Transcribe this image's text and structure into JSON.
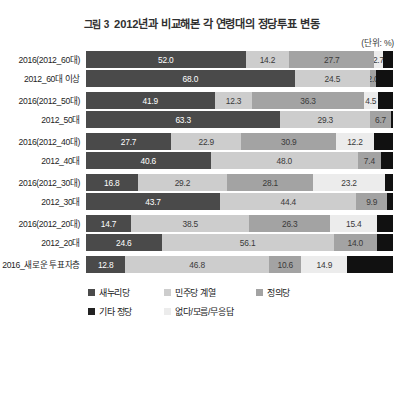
{
  "header": {
    "figure_number": "그림 3",
    "title": "2012년과 비교해본 각 연령대의 정당투표 변동",
    "unit_note": "(단위: %)"
  },
  "legend": {
    "items": [
      {
        "label": "새누리당",
        "color": "#4a4a4a"
      },
      {
        "label": "민주당 계열",
        "color": "#cdcdcd"
      },
      {
        "label": "정의당",
        "color": "#a3a3a3"
      },
      {
        "label": "기타 정당",
        "color": "#222222"
      },
      {
        "label": "없다/모름/무응답",
        "color": "#ececec"
      }
    ]
  },
  "chart_data": {
    "type": "bar",
    "orientation": "horizontal",
    "stacked": true,
    "stack_normalized": true,
    "title": "2012년과 비교해본 각 연령대의 정당투표 변동",
    "xlabel": "",
    "ylabel": "",
    "unit": "%",
    "xlim": [
      0,
      100
    ],
    "grid": false,
    "legend_position": "bottom",
    "series": [
      {
        "name": "새누리당",
        "color": "#4a4a4a"
      },
      {
        "name": "민주당 계열",
        "color": "#cdcdcd"
      },
      {
        "name": "정의당",
        "color": "#a3a3a3"
      },
      {
        "name": "기타 정당",
        "color": "#ececec"
      },
      {
        "name": "없다/모름/무응답",
        "color": "#111111"
      }
    ],
    "groups": [
      {
        "name": "60대",
        "rows": [
          {
            "category": "2016(2012_60대)",
            "values": [
              52.0,
              14.2,
              27.7,
              2.7,
              3.4
            ],
            "labels": [
              "52.0",
              "14.2",
              "27.7",
              "2.7",
              ""
            ]
          },
          {
            "category": "2012_60대 이상",
            "values": [
              68.0,
              24.5,
              2.0,
              0.0,
              5.5
            ],
            "labels": [
              "68.0",
              "24.5",
              "2.0",
              "",
              ""
            ]
          }
        ]
      },
      {
        "name": "50대",
        "rows": [
          {
            "category": "2016(2012_50대)",
            "values": [
              41.9,
              12.3,
              36.3,
              4.5,
              5.0
            ],
            "labels": [
              "41.9",
              "12.3",
              "36.3",
              "4.5",
              ""
            ]
          },
          {
            "category": "2012_50대",
            "values": [
              63.3,
              29.3,
              6.7,
              0.0,
              0.7
            ],
            "labels": [
              "63.3",
              "29.3",
              "6.7",
              "",
              ""
            ]
          }
        ]
      },
      {
        "name": "40대",
        "rows": [
          {
            "category": "2016(2012_40대)",
            "values": [
              27.7,
              22.9,
              30.9,
              12.2,
              6.3
            ],
            "labels": [
              "27.7",
              "22.9",
              "30.9",
              "12.2",
              ""
            ]
          },
          {
            "category": "2012_40대",
            "values": [
              40.6,
              48.0,
              7.4,
              0.0,
              4.0
            ],
            "labels": [
              "40.6",
              "48.0",
              "7.4",
              "",
              ""
            ]
          }
        ]
      },
      {
        "name": "30대",
        "rows": [
          {
            "category": "2016(2012_30대)",
            "values": [
              16.8,
              29.2,
              28.1,
              23.2,
              2.7
            ],
            "labels": [
              "16.8",
              "29.2",
              "28.1",
              "23.2",
              ""
            ]
          },
          {
            "category": "2012_30대",
            "values": [
              43.7,
              44.4,
              9.9,
              0.0,
              2.0
            ],
            "labels": [
              "43.7",
              "44.4",
              "9.9",
              "",
              ""
            ]
          }
        ]
      },
      {
        "name": "20대",
        "rows": [
          {
            "category": "2016(2012_20대)",
            "values": [
              14.7,
              38.5,
              26.3,
              15.4,
              5.1
            ],
            "labels": [
              "14.7",
              "38.5",
              "26.3",
              "15.4",
              ""
            ]
          },
          {
            "category": "2012_20대",
            "values": [
              24.6,
              56.1,
              14.0,
              0.0,
              5.3
            ],
            "labels": [
              "24.6",
              "56.1",
              "14.0",
              "",
              ""
            ]
          }
        ]
      },
      {
        "name": "새로운 투표자층",
        "rows": [
          {
            "category": "2016_새로운 투표자층",
            "values": [
              12.8,
              46.8,
              10.6,
              14.9,
              14.9
            ],
            "labels": [
              "12.8",
              "46.8",
              "10.6",
              "14.9",
              ""
            ]
          }
        ]
      }
    ]
  }
}
